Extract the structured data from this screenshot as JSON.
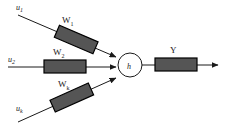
{
  "figure": {
    "type": "neuron-diagram",
    "background_color": "#ffffff",
    "line_color": "#1a1a1a",
    "weight_box_fill": "#555555",
    "weight_box_stroke": "#000000",
    "node_fill": "#ffffff",
    "node_stroke": "#1a1a1a"
  },
  "node": {
    "label": "h",
    "cx": 130,
    "cy": 65,
    "r": 12
  },
  "inputs": [
    {
      "id": "input-1",
      "signal_base": "u",
      "signal_sub": "1",
      "weight_base": "W",
      "weight_sub": "1",
      "direction": "down-right"
    },
    {
      "id": "input-2",
      "signal_base": "u",
      "signal_sub": "2",
      "weight_base": "W",
      "weight_sub": "2",
      "direction": "right"
    },
    {
      "id": "input-k",
      "signal_base": "u",
      "signal_sub": "k",
      "weight_base": "W",
      "weight_sub": "k",
      "direction": "up-right"
    }
  ],
  "output": {
    "id": "output-y",
    "weight_base": "Y",
    "weight_sub": "",
    "direction": "right"
  }
}
